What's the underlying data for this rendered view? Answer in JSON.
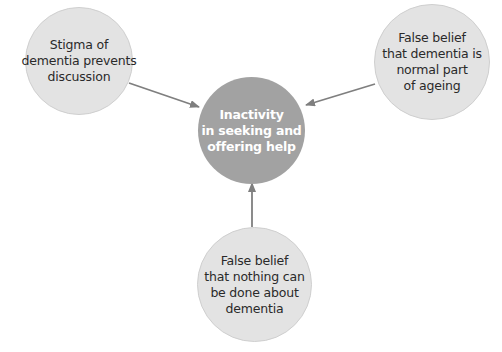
{
  "diagram": {
    "colors": {
      "outer_fill": "#e3e3e3",
      "center_fill": "#a2a2a2",
      "arrow": "#7f7f7f",
      "outer_text": "#2a2a2a",
      "center_text": "#ffffff"
    },
    "center": {
      "lines": [
        "Inactivity",
        "in seeking and",
        "offering help"
      ]
    },
    "nodes": {
      "left": {
        "lines": [
          "Stigma of",
          "dementia prevents",
          "discussion"
        ]
      },
      "right": {
        "lines": [
          "False belief",
          "that dementia is",
          "normal part",
          "of ageing"
        ]
      },
      "bottom": {
        "lines": [
          "False belief",
          "that nothing can",
          "be done about",
          "dementia"
        ]
      }
    },
    "edges": [
      {
        "from": "left",
        "to": "center"
      },
      {
        "from": "right",
        "to": "center"
      },
      {
        "from": "bottom",
        "to": "center"
      }
    ]
  }
}
